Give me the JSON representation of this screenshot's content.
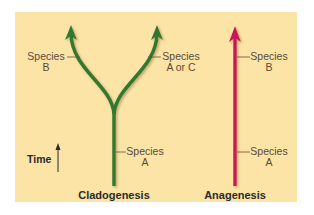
{
  "colors": {
    "background": "#fbe4a6",
    "cladogenesis_line": "#2f7a2f",
    "anagenesis_line": "#c8185a",
    "leader_line": "#6b4a3a",
    "text": "#5a4a3a"
  },
  "time_axis": {
    "label": "Time"
  },
  "cladogenesis": {
    "title": "Cladogenesis",
    "labels": {
      "left_branch": {
        "line1": "Species",
        "line2": "B"
      },
      "right_branch": {
        "line1": "Species",
        "line2": "A or C"
      },
      "stem": {
        "line1": "Species",
        "line2": "A"
      }
    }
  },
  "anagenesis": {
    "title": "Anagenesis",
    "labels": {
      "top": {
        "line1": "Species",
        "line2": "B"
      },
      "bottom": {
        "line1": "Species",
        "line2": "A"
      }
    }
  }
}
